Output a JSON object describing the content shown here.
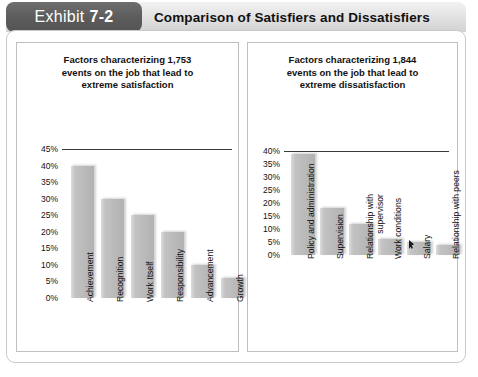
{
  "header": {
    "exhibit_word": "Exhibit",
    "exhibit_number": "7-2",
    "title": "Comparison of Satisfiers and Dissatisfiers",
    "tag_color": "#5b5b5b",
    "bar_color": "#e2e2e2"
  },
  "chart_data": [
    {
      "type": "bar",
      "id": "satisfiers",
      "title": "Factors characterizing 1,753\nevents on the job that lead to\nextreme satisfaction",
      "categories": [
        "Achievement",
        "Recognition",
        "Work Itself",
        "Responsibility",
        "Advancement",
        "Growth"
      ],
      "values": [
        40,
        30,
        25,
        20,
        10,
        6
      ],
      "tick_labels": [
        "45%",
        "40%",
        "35%",
        "30%",
        "25%",
        "20%",
        "15%",
        "10%",
        "5%",
        "0%"
      ],
      "ticks": [
        45,
        40,
        35,
        30,
        25,
        20,
        15,
        10,
        5,
        0
      ],
      "ylim": [
        0,
        45
      ],
      "xlabel": "",
      "ylabel": "",
      "grid": false,
      "legend": "none",
      "bar_color": "#b9b9b9"
    },
    {
      "type": "bar",
      "id": "dissatisfiers",
      "title": "Factors characterizing 1,844\nevents on the job that lead to\nextreme dissatisfaction",
      "categories": [
        "Policy and administration",
        "Supervision",
        "Relationship with\nsupervisor",
        "Work conditions",
        "Salary",
        "Relationship with peers"
      ],
      "values": [
        39,
        18,
        12,
        6,
        5,
        4
      ],
      "tick_labels": [
        "40%",
        "35%",
        "30%",
        "25%",
        "20%",
        "15%",
        "10%",
        "5%",
        "0%"
      ],
      "ticks": [
        40,
        35,
        30,
        25,
        20,
        15,
        10,
        5,
        0
      ],
      "ylim": [
        0,
        40
      ],
      "xlabel": "",
      "ylabel": "",
      "grid": false,
      "legend": "none",
      "bar_color": "#b9b9b9"
    }
  ],
  "cursor": {
    "name": "mouse-pointer",
    "over_category": "Salary"
  }
}
